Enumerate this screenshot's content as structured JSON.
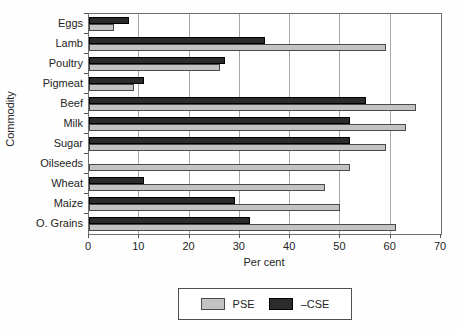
{
  "figure": {
    "xlabel": "Per cent",
    "ylabel": "Commodity",
    "legend": {
      "pse_label": "PSE",
      "cse_label": "–CSE"
    },
    "colors": {
      "pse": "#c3c3c3",
      "cse": "#2b2b2b",
      "grid": "#a8a8a8",
      "frame": "#6e6e6e"
    }
  },
  "chart_data": {
    "type": "bar",
    "orientation": "horizontal",
    "title": "",
    "xlabel": "Per cent",
    "ylabel": "Commodity",
    "categories": [
      "Eggs",
      "Lamb",
      "Poultry",
      "Pigmeat",
      "Beef",
      "Milk",
      "Sugar",
      "Oilseeds",
      "Wheat",
      "Maize",
      "O. Grains"
    ],
    "series": [
      {
        "name": "PSE",
        "color": "#c3c3c3",
        "values": [
          5,
          59,
          26,
          9,
          65,
          63,
          59,
          52,
          47,
          50,
          61
        ]
      },
      {
        "name": "–CSE",
        "color": "#2b2b2b",
        "values": [
          8,
          35,
          27,
          11,
          55,
          52,
          52,
          0,
          11,
          29,
          32
        ]
      }
    ],
    "bar_order_top_to_bottom": [
      "–CSE",
      "PSE"
    ],
    "xlim": [
      0,
      70
    ],
    "xticks": [
      0,
      10,
      20,
      30,
      40,
      50,
      60,
      70
    ],
    "grid": true,
    "legend_position": "bottom"
  }
}
